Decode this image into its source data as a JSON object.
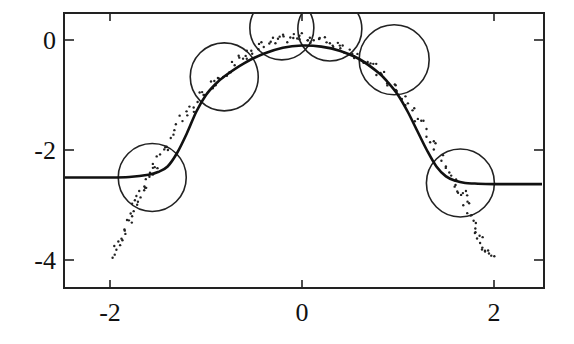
{
  "chart_data": {
    "type": "scatter",
    "title": "",
    "xlabel": "",
    "ylabel": "",
    "xlim": [
      -2.5,
      2.5
    ],
    "ylim": [
      -4.5,
      0.5
    ],
    "grid": false,
    "legend": null,
    "x_ticks": [
      -2,
      0,
      2
    ],
    "x_tick_labels": [
      "-2",
      "0",
      "2"
    ],
    "y_ticks": [
      0,
      -2,
      -4
    ],
    "y_tick_labels": [
      "0",
      "-2",
      "-4"
    ],
    "series": [
      {
        "name": "fitted-curve",
        "kind": "line",
        "x": [
          -2.5,
          -2.0,
          -1.8,
          -1.6,
          -1.5,
          -1.4,
          -1.3,
          -1.2,
          -1.1,
          -1.0,
          -0.9,
          -0.8,
          -0.6,
          -0.4,
          -0.2,
          0.0,
          0.2,
          0.4,
          0.6,
          0.8,
          0.9,
          1.0,
          1.1,
          1.2,
          1.3,
          1.4,
          1.5,
          1.6,
          1.7,
          1.8,
          2.0,
          2.5
        ],
        "y": [
          -2.5,
          -2.5,
          -2.49,
          -2.45,
          -2.4,
          -2.3,
          -2.05,
          -1.7,
          -1.3,
          -1.0,
          -0.8,
          -0.65,
          -0.42,
          -0.25,
          -0.14,
          -0.1,
          -0.12,
          -0.2,
          -0.35,
          -0.6,
          -0.78,
          -1.0,
          -1.3,
          -1.65,
          -2.0,
          -2.3,
          -2.48,
          -2.56,
          -2.6,
          -2.61,
          -2.62,
          -2.62
        ]
      },
      {
        "name": "data-points",
        "kind": "scatter",
        "x": [
          -1.95,
          -1.93,
          -1.9,
          -1.88,
          -1.85,
          -1.83,
          -1.8,
          -1.78,
          -1.75,
          -1.72,
          -1.7,
          -1.68,
          -1.65,
          -1.62,
          -1.6,
          -1.58,
          -1.55,
          -1.52,
          -1.5,
          -1.45,
          -1.4,
          -1.35,
          -1.3,
          -1.25,
          -1.2,
          -1.15,
          -1.1,
          -1.05,
          -1.0,
          -0.95,
          -0.9,
          -0.85,
          -0.8,
          -0.75,
          -0.7,
          -0.65,
          -0.6,
          -0.55,
          -0.5,
          -0.45,
          -0.4,
          -0.35,
          -0.3,
          -0.25,
          -0.2,
          -0.15,
          -0.1,
          -0.05,
          0.0,
          0.05,
          0.1,
          0.15,
          0.2,
          0.25,
          0.3,
          0.35,
          0.4,
          0.45,
          0.5,
          0.55,
          0.6,
          0.65,
          0.7,
          0.75,
          0.8,
          0.85,
          0.9,
          0.95,
          1.0,
          1.05,
          1.1,
          1.15,
          1.2,
          1.25,
          1.3,
          1.35,
          1.4,
          1.45,
          1.5,
          1.55,
          1.6,
          1.62,
          1.65,
          1.68,
          1.7,
          1.72,
          1.75,
          1.78,
          1.8,
          1.83,
          1.85,
          1.88,
          1.9,
          1.93,
          1.95,
          1.98
        ],
        "y": [
          -3.95,
          -3.85,
          -3.75,
          -3.6,
          -3.5,
          -3.4,
          -3.3,
          -3.2,
          -3.1,
          -3.0,
          -2.95,
          -2.85,
          -2.75,
          -2.65,
          -2.55,
          -2.45,
          -2.35,
          -2.3,
          -2.2,
          -2.05,
          -1.95,
          -1.8,
          -1.65,
          -1.5,
          -1.4,
          -1.3,
          -1.2,
          -1.05,
          -0.95,
          -0.85,
          -0.78,
          -0.7,
          -0.62,
          -0.55,
          -0.48,
          -0.4,
          -0.35,
          -0.3,
          -0.25,
          -0.18,
          -0.15,
          -0.1,
          -0.08,
          -0.05,
          -0.03,
          0.0,
          0.02,
          0.0,
          0.0,
          0.02,
          0.0,
          -0.02,
          -0.04,
          -0.06,
          -0.08,
          -0.1,
          -0.14,
          -0.18,
          -0.22,
          -0.28,
          -0.33,
          -0.4,
          -0.46,
          -0.55,
          -0.62,
          -0.7,
          -0.8,
          -0.88,
          -0.98,
          -1.08,
          -1.2,
          -1.32,
          -1.45,
          -1.58,
          -1.72,
          -1.85,
          -2.0,
          -2.15,
          -2.3,
          -2.45,
          -2.6,
          -2.7,
          -2.78,
          -2.85,
          -2.95,
          -3.05,
          -3.15,
          -3.3,
          -3.4,
          -3.5,
          -3.6,
          -3.7,
          -3.78,
          -3.85,
          -3.92,
          -4.0
        ]
      },
      {
        "name": "neighborhood-circles",
        "kind": "circles",
        "centers": [
          {
            "x": -1.56,
            "y": -2.5,
            "r_px": 34
          },
          {
            "x": -0.81,
            "y": -0.67,
            "r_px": 34
          },
          {
            "x": -0.21,
            "y": 0.22,
            "r_px": 32
          },
          {
            "x": 0.29,
            "y": 0.2,
            "r_px": 32
          },
          {
            "x": 0.96,
            "y": -0.36,
            "r_px": 35
          },
          {
            "x": 1.65,
            "y": -2.6,
            "r_px": 34
          }
        ]
      }
    ],
    "colors": {
      "line": "#111111",
      "points": "#222222",
      "circles": "#222222",
      "background": "#ffffff"
    }
  }
}
